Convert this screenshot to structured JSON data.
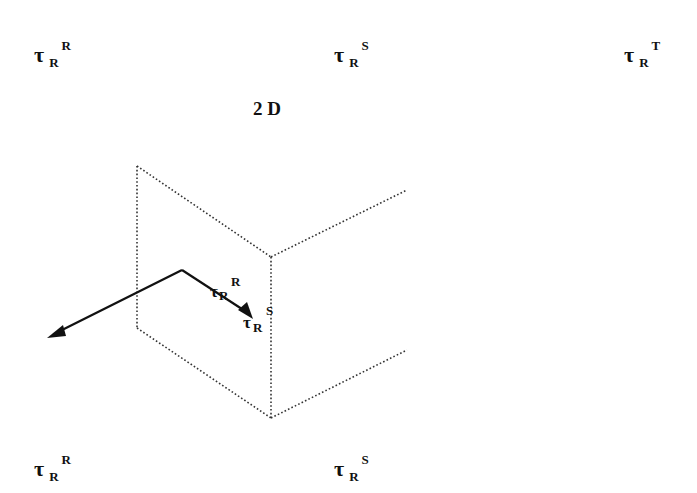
{
  "diagram": {
    "title": "2 D",
    "labels_top": [
      {
        "symbol": "τ",
        "sub": "R",
        "sup": "R"
      },
      {
        "symbol": "τ",
        "sub": "R",
        "sup": "S"
      },
      {
        "symbol": "τ",
        "sub": "R",
        "sup": "T"
      }
    ],
    "labels_bottom": [
      {
        "symbol": "τ",
        "sub": "R",
        "sup": "R"
      },
      {
        "symbol": "τ",
        "sub": "R",
        "sup": "S"
      }
    ],
    "inner_labels": {
      "reflected": {
        "symbol": "τ",
        "sub": "R",
        "sup": "R"
      },
      "transmitted": {
        "symbol": "τ",
        "sub": "R",
        "sup": "S"
      }
    },
    "colors": {
      "ink": "#111111",
      "dotted": "#333333",
      "background": "#ffffff"
    }
  }
}
